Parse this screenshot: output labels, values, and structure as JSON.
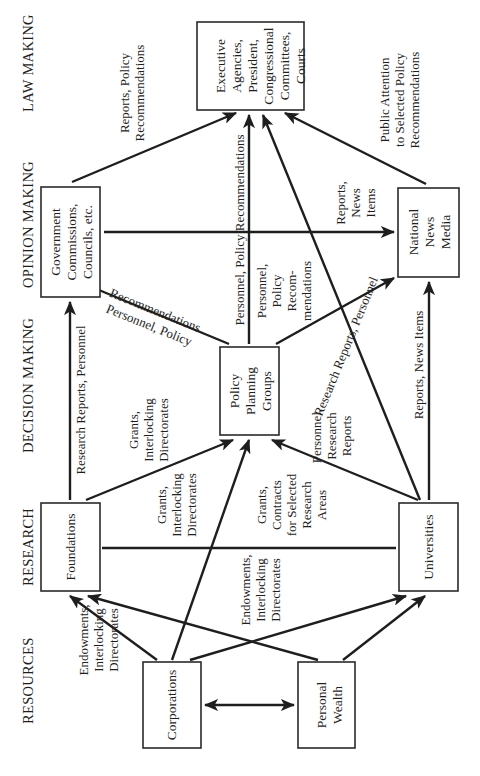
{
  "diagram": {
    "orientation": "rotated 90 degrees counter-clockwise",
    "columns": [
      {
        "id": "resources",
        "label": "RESOURCES"
      },
      {
        "id": "research",
        "label": "RESEARCH"
      },
      {
        "id": "decision",
        "label": "DECISION MAKING"
      },
      {
        "id": "opinion",
        "label": "OPINION MAKING"
      },
      {
        "id": "law",
        "label": "LAW MAKING"
      }
    ],
    "nodes": {
      "corporations": {
        "lines": [
          "Corporations"
        ]
      },
      "personal_wealth": {
        "lines": [
          "Personal",
          "Wealth"
        ]
      },
      "foundations": {
        "lines": [
          "Foundations"
        ]
      },
      "universities": {
        "lines": [
          "Universities"
        ]
      },
      "policy_planning": {
        "lines": [
          "Policy",
          "Planning",
          "Groups"
        ]
      },
      "gov_commissions": {
        "lines": [
          "Government",
          "Commissions,",
          "Councils, etc."
        ]
      },
      "news_media": {
        "lines": [
          "National",
          "News",
          "Media"
        ]
      },
      "executive": {
        "lines": [
          "Executive",
          "Agencies,",
          "President,",
          "Congressional",
          "Committees,",
          "Courts"
        ]
      }
    },
    "edge_labels": {
      "resources_to_foundations": [
        "Endowments,",
        "Interlocking",
        "Directorates"
      ],
      "corp_to_universities": [
        "Endowments,",
        "Interlocking",
        "Directorates"
      ],
      "foundations_to_gov": [
        "Research Reports, Personnel"
      ],
      "foundations_to_policy": [
        "Grants,",
        "Interlocking",
        "Directorates"
      ],
      "corp_to_policy": [
        "Grants,",
        "Interlocking",
        "Directorates"
      ],
      "foundations_to_universities": [
        "Grants,",
        "Contracts",
        "for Selected",
        "Research",
        "Areas"
      ],
      "universities_to_policy": [
        "Personnel,",
        "Research",
        "Reports"
      ],
      "policy_to_gov": [
        "Personnel, Policy",
        "Recommendations"
      ],
      "policy_to_executive": [
        "Personnel, Policy  Recommendations"
      ],
      "policy_to_media": [
        "Personnel,",
        "Policy",
        "Recom-",
        "mendations"
      ],
      "universities_to_executive": [
        "Research Reports, Personnel"
      ],
      "universities_to_media": [
        "Reports, News Items"
      ],
      "gov_to_executive": [
        "Reports, Policy",
        "Recommendations"
      ],
      "gov_to_media": [
        "Reports,",
        "News",
        "Items"
      ],
      "media_to_executive": [
        "Public Attention",
        "to Selected Policy",
        "Recommendations"
      ]
    }
  }
}
